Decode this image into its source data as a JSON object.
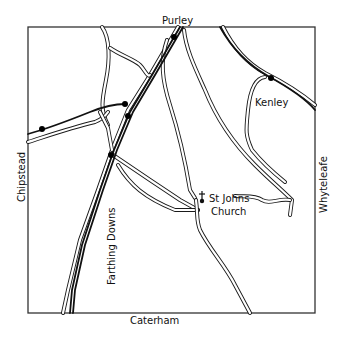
{
  "map": {
    "title_labels": {
      "north": "Purley",
      "south": "Caterham",
      "west": "Chipstead",
      "east": "Whyteleafe"
    },
    "place_labels": {
      "kenley": "Kenley",
      "farthing_downs": "Farthing Downs",
      "church_line1": "St Johns",
      "church_line2": "Church"
    },
    "icons": {
      "church": "church-cross-icon",
      "station": "station-dot-icon"
    },
    "colors": {
      "ink": "#1a1a1a",
      "paper": "#ffffff",
      "frame": "#333333"
    },
    "stations": [
      {
        "name": "purley-station",
        "x": 174,
        "y": 37
      },
      {
        "name": "chipstead-line-station",
        "x": 42,
        "y": 129
      },
      {
        "name": "junction-station-upper",
        "x": 125,
        "y": 104
      },
      {
        "name": "junction-station-lower",
        "x": 128,
        "y": 116
      },
      {
        "name": "farthing-station",
        "x": 111,
        "y": 155
      },
      {
        "name": "kenley-station",
        "x": 271,
        "y": 78
      }
    ]
  }
}
